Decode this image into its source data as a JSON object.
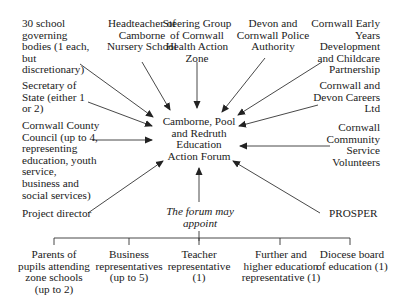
{
  "diagram": {
    "center": {
      "label": "Camborne, Pool\nand Redruth\nEducation\nAction Forum"
    },
    "members": [
      {
        "id": "governing-bodies",
        "label": "30 school\ngoverning\nbodies (1 each,\nbut\ndiscretionary)"
      },
      {
        "id": "headteacher",
        "label": "Headteacher of\nCamborne\nNursery School"
      },
      {
        "id": "steering-group",
        "label": "Steering Group\nof Cornwall\nHealth Action\nZone"
      },
      {
        "id": "police-authority",
        "label": "Devon and\nCornwall Police\nAuthority"
      },
      {
        "id": "early-years",
        "label": "Cornwall Early\nYears\nDevelopment\nand Childcare\nPartnership"
      },
      {
        "id": "secretary-of-state",
        "label": "Secretary of\nState (either 1\nor 2)"
      },
      {
        "id": "careers",
        "label": "Cornwall and\nDevon Careers\nLtd"
      },
      {
        "id": "county-council",
        "label": "Cornwall County\nCouncil (up to 4,\nrepresenting\neducation, youth\nservice,\nbusiness and\nsocial services)"
      },
      {
        "id": "volunteers",
        "label": "Cornwall\nCommunity\nService\nVolunteers"
      },
      {
        "id": "project-director",
        "label": "Project director"
      },
      {
        "id": "prosper",
        "label": "PROSPER"
      }
    ],
    "appoint": {
      "label": "The forum may\nappoint",
      "options": [
        {
          "id": "parents",
          "label": "Parents of\npupils attending\nzone schools\n(up to 2)"
        },
        {
          "id": "business",
          "label": "Business\nrepresentatives\n(up to 5)"
        },
        {
          "id": "teacher",
          "label": "Teacher\nrepresentative\n(1)"
        },
        {
          "id": "further-higher",
          "label": "Further and\nhigher education\nrepresentative (1)"
        },
        {
          "id": "diocese",
          "label": "Diocese board\nof education (1)"
        }
      ]
    },
    "colors": {
      "line": "#333333",
      "text": "#1a1a1a",
      "background": "#ffffff"
    }
  }
}
